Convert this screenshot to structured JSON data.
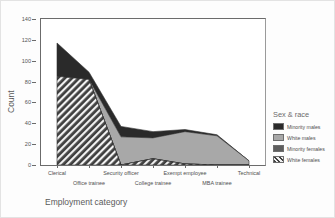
{
  "chart_data": {
    "type": "area",
    "title": "",
    "xlabel": "Employment category",
    "ylabel": "Count",
    "ylim": [
      0,
      140
    ],
    "yticks": [
      0,
      20,
      40,
      60,
      80,
      100,
      120,
      140
    ],
    "grid": false,
    "legend_position": "right",
    "legend_title": "Sex & race",
    "categories": [
      "Clerical",
      "Office trainee",
      "Security officer",
      "College trainee",
      "Exempt employee",
      "MBA trainee",
      "Technical"
    ],
    "series": [
      {
        "name": "White females",
        "values": [
          85,
          82,
          0,
          6,
          1,
          0,
          0
        ],
        "color": "#3a3a3a",
        "pattern": "diagonal-hatch"
      },
      {
        "name": "Minority females",
        "values": [
          0,
          0,
          0,
          0,
          0,
          0,
          0
        ],
        "color": "#585858",
        "pattern": "solid"
      },
      {
        "name": "White males",
        "values": [
          0,
          0,
          27,
          20,
          31,
          28,
          4
        ],
        "color": "#a8a8a8",
        "pattern": "solid"
      },
      {
        "name": "Minority males",
        "values": [
          32,
          7,
          10,
          6,
          2,
          1,
          0
        ],
        "color": "#2a2a2a",
        "pattern": "solid"
      }
    ],
    "stack_totals": [
      117,
      89,
      37,
      32,
      34,
      29,
      4
    ],
    "legend_entries": [
      {
        "label": "Minority males",
        "color": "#2a2a2a",
        "pattern": "solid"
      },
      {
        "label": "White males",
        "color": "#a8a8a8",
        "pattern": "solid"
      },
      {
        "label": "Minority females",
        "color": "#5e5e5e",
        "pattern": "solid"
      },
      {
        "label": "White females",
        "color": "#3a3a3a",
        "pattern": "diagonal-hatch"
      }
    ]
  }
}
